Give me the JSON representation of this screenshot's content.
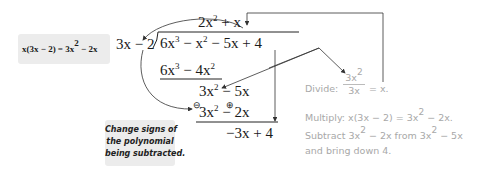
{
  "left_callout": {
    "text_parts": [
      "x(3x − 2) = 3x",
      "2",
      " − 2x"
    ]
  },
  "division": {
    "divisor": "3x − 2",
    "quotient": [
      "2x",
      "2",
      " + ",
      "x"
    ],
    "dividend": [
      "6x",
      "3",
      " − ",
      "x",
      "2",
      " − 5x + 4"
    ],
    "step1": [
      "6x",
      "3",
      " − 4x",
      "2"
    ],
    "step2": [
      "3x",
      "2",
      " − 5x"
    ],
    "step3": [
      "3x",
      "2",
      " − 2x"
    ],
    "step3_sign_left": "⊖",
    "step3_sign_right": "⊕",
    "remainder": "−3x + 4"
  },
  "bottom_callout": {
    "lines": [
      "Change signs of",
      "the polynomial",
      "being subtracted."
    ]
  },
  "notes": {
    "divide_label": "Divide:",
    "divide_num": [
      "3x",
      "2"
    ],
    "divide_den": "3x",
    "divide_result": "= x.",
    "multiply": [
      "Multiply: x(3x − 2) = 3x",
      "2",
      " − 2x."
    ],
    "subtract_line1": [
      "Subtract 3x",
      "2",
      " − 2x from 3x",
      "2",
      " − 5x"
    ],
    "subtract_line2": "and bring down 4."
  }
}
